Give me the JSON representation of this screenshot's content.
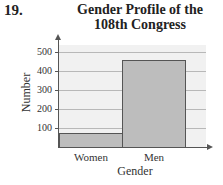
{
  "problem_number": "19.",
  "chart_data": {
    "type": "bar",
    "title_line1": "Gender Profile of the",
    "title_line2": "108th Congress",
    "title": "Gender Profile of the 108th Congress",
    "xlabel": "Gender",
    "ylabel": "Number",
    "categories": [
      "Women",
      "Men"
    ],
    "values": [
      76,
      459
    ],
    "yticks": [
      "100",
      "200",
      "300",
      "400",
      "500"
    ],
    "ylim": [
      0,
      550
    ],
    "grid": true,
    "legend": null,
    "bar_color": "#bdbdbd"
  }
}
